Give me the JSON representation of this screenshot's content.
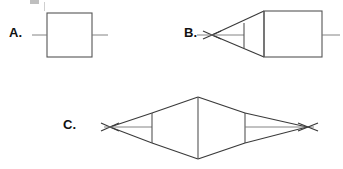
{
  "figure": {
    "background_color": "#ffffff",
    "line_color": "#555555",
    "label_color": "#111111",
    "width": 343,
    "height": 169
  },
  "panels": [
    {
      "id": "a",
      "label": "A.",
      "name": "plane-parallel-plate",
      "description": "Rectangular block with horizontal optical axis stubs entering left and exiting right; rays remain parallel, no focus.",
      "geometry": {
        "body_type": "rectangle",
        "rect_left": 47,
        "rect_top": 13,
        "rect_right": 92,
        "rect_bottom": 57,
        "axis_y": 35,
        "axis_left_start": 32,
        "axis_left_end": 47,
        "axis_right_start": 92,
        "axis_right_end": 108
      },
      "focus_points": []
    },
    {
      "id": "b",
      "label": "B.",
      "name": "single-taper-converging",
      "description": "Rectangle with a conical taper on the left converging to a single crossing point (X) on the optical axis; straight exit ray at right.",
      "geometry": {
        "body_type": "rectangle-with-left-cone",
        "rect_left": 264,
        "rect_top": 11,
        "rect_right": 322,
        "rect_bottom": 57,
        "neck_x": 244,
        "neck_top": 23,
        "neck_bottom": 48,
        "apex_x": 212,
        "axis_y": 35,
        "axis_left_start": 197,
        "axis_left_end": 244,
        "axis_right_start": 322,
        "axis_right_end": 340,
        "cross_overshoot": 9
      },
      "focus_points": [
        {
          "x": 212,
          "y": 35,
          "marker": "x-cross"
        }
      ]
    },
    {
      "id": "c",
      "label": "C.",
      "name": "double-taper-biconical",
      "description": "Symmetric biconical (diamond) body with tapers converging to crossing points (X) at both left and right on the optical axis; vertical lines mark both taper necks and the central apex plane.",
      "geometry": {
        "body_type": "biconical-diamond",
        "center_x": 198,
        "apex_top_y": 97,
        "apex_bottom_y": 159,
        "neck_left_x": 152,
        "neck_right_x": 245,
        "neck_top": 113,
        "neck_bottom": 143,
        "axis_y": 127,
        "focus_left_x": 110,
        "focus_right_x": 307,
        "axis_left_start": 101,
        "axis_right_end": 318,
        "cross_overshoot": 9
      },
      "focus_points": [
        {
          "x": 110,
          "y": 127,
          "marker": "x-cross"
        },
        {
          "x": 307,
          "y": 127,
          "marker": "x-cross"
        }
      ]
    }
  ],
  "annotations": {
    "corner_artifact": "cropped-page-mark"
  }
}
